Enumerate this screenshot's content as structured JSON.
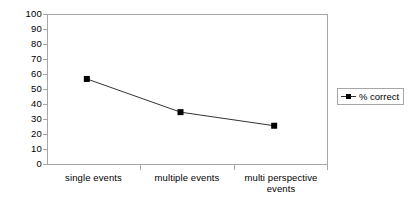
{
  "chart_data": {
    "type": "line",
    "title": "",
    "xlabel": "",
    "ylabel": "",
    "categories": [
      "single events",
      "multiple events",
      "multi perspective events"
    ],
    "series": [
      {
        "name": "% correct",
        "values": [
          57,
          35,
          26
        ],
        "marker": "square",
        "color": "#000000",
        "line_color": "#333333"
      }
    ],
    "ylim": [
      0,
      100
    ],
    "yticks": [
      0,
      10,
      20,
      30,
      40,
      50,
      60,
      70,
      80,
      90,
      100
    ],
    "ytick_labels": [
      "0",
      "10",
      "20",
      "30",
      "40",
      "50",
      "60",
      "70",
      "80",
      "90",
      "100"
    ],
    "grid": false,
    "legend_position": "right",
    "legend_entries": [
      "% correct"
    ],
    "axis_color": "#a6a6a6",
    "background": "#ffffff"
  },
  "legend": {
    "series_label": "% correct",
    "marker_icon": "square-marker-icon"
  },
  "xaxis": {
    "labels": [
      {
        "line1": "single events",
        "line2": ""
      },
      {
        "line1": "multiple events",
        "line2": ""
      },
      {
        "line1": "multi perspective",
        "line2": "events"
      }
    ]
  }
}
